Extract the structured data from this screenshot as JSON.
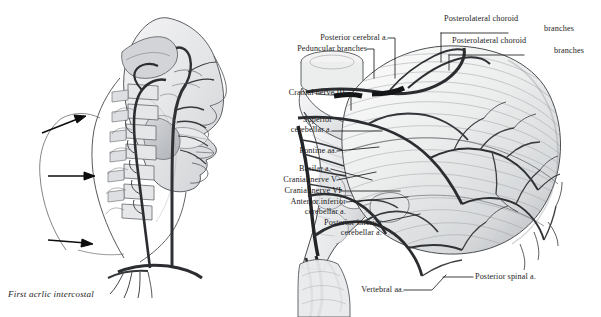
{
  "plate": {
    "background": "#ffffff",
    "ink": "#1c1c1c",
    "artery_color": "#2b2b2b",
    "wash_color": "#b9bcc0",
    "width": 601,
    "height": 317
  },
  "figures": [
    {
      "id": "lateral-head-neck",
      "name": "lateral head and neck vasculature",
      "description": "Lateral view pen-and-ink drawing of the head and neck showing the vertebral artery ascending through the transverse foramina, with three black arrows indicating its course",
      "arrow_count": 3
    },
    {
      "id": "brainstem-cerebellum",
      "name": "brainstem and cerebellum posterolateral view",
      "description": "Posterolateral view of the brainstem and cerebellum with the vertebrobasilar arterial system",
      "folia_visible": true
    }
  ],
  "caption": {
    "text": "First acrlic intercostal"
  },
  "labels": [
    {
      "id": "posterior-cerebral-a",
      "text": "Posterior cerebral a.",
      "align": "right"
    },
    {
      "id": "peduncular-branches",
      "text": "Peduncular branches",
      "align": "right"
    },
    {
      "id": "posterolateral-choroid-1",
      "text": "Posterolateral choroid",
      "align": "left"
    },
    {
      "id": "posterolateral-choroid-1b",
      "text": "branches",
      "align": "right"
    },
    {
      "id": "posterolateral-choroid-2",
      "text": "Posterolateral choroid",
      "align": "left"
    },
    {
      "id": "posterolateral-choroid-2b",
      "text": "branches",
      "align": "right"
    },
    {
      "id": "cranial-nerve-3",
      "text": "Cranial nerve  III",
      "align": "right"
    },
    {
      "id": "superior-cerebellar-a-1",
      "text": "Superior",
      "align": "right"
    },
    {
      "id": "superior-cerebellar-a-2",
      "text": "cerebellar a.",
      "align": "right"
    },
    {
      "id": "pontine-aa",
      "text": "Pontine aa.",
      "align": "right"
    },
    {
      "id": "basilar-a",
      "text": "Basilar a.",
      "align": "right"
    },
    {
      "id": "cranial-nerve-5",
      "text": "Cranial nerve  V",
      "align": "right"
    },
    {
      "id": "cranial-nerve-6",
      "text": "Cranial nerve  VI",
      "align": "right"
    },
    {
      "id": "aica-1",
      "text": "Anterior.inferior",
      "align": "right"
    },
    {
      "id": "aica-2",
      "text": "cerebellar a.",
      "align": "right"
    },
    {
      "id": "pica-1",
      "text": "Posterior inferior",
      "align": "right"
    },
    {
      "id": "pica-2",
      "text": "cerebellar a.",
      "align": "right"
    },
    {
      "id": "vertebral-aa",
      "text": "Vertebral aa.",
      "align": "right"
    },
    {
      "id": "posterior-spinal-a",
      "text": "Posterior spinal a.",
      "align": "left"
    }
  ]
}
